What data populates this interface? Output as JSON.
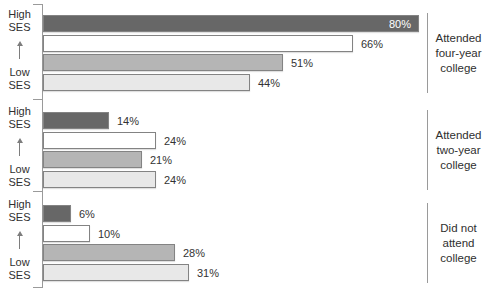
{
  "chart_data": {
    "type": "bar",
    "orientation": "horizontal",
    "title": "",
    "unit": "%",
    "xlim": [
      0,
      100
    ],
    "grid": false,
    "legend": "none",
    "ses_axis": {
      "high_label": "High SES",
      "low_label": "Low SES",
      "arrow_direction": "up"
    },
    "bar_order_note": "Bars within each group run from High SES (top) to Low SES (bottom)",
    "groups": [
      {
        "label": "Attended four-year college",
        "label_lines": [
          "Attended",
          "four-year",
          "college"
        ],
        "values": [
          80,
          66,
          51,
          44
        ]
      },
      {
        "label": "Attended two-year college",
        "label_lines": [
          "Attended",
          "two-year",
          "college"
        ],
        "values": [
          14,
          24,
          21,
          24
        ]
      },
      {
        "label": "Did not attend college",
        "label_lines": [
          "Did not",
          "attend",
          "college"
        ],
        "values": [
          6,
          10,
          28,
          31
        ]
      }
    ],
    "colors": {
      "bar_fills": [
        "#676767",
        "#ffffff",
        "#b5b5b5",
        "#e8e8e8"
      ],
      "bar_border": "#838383",
      "axis": "#9a9a9a",
      "text": "#2f2f2f",
      "value_label_outside": "#333333",
      "value_label_inside": "#ffffff"
    }
  }
}
